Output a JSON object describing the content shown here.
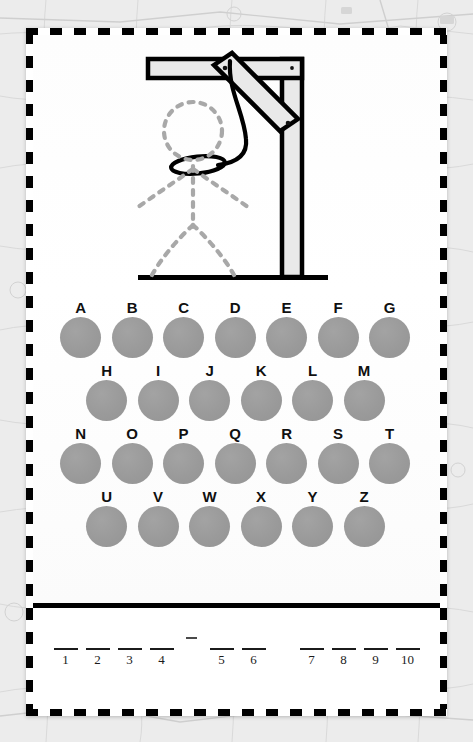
{
  "game": {
    "title": "Hangman",
    "gallows": {
      "name": "gallows-illustration",
      "beam_fill": "#e9e9e9",
      "beam_stroke": "#000000",
      "figure_stroke": "#a8a8a8",
      "rope_color": "#000000",
      "parts": [
        "ground-line",
        "vertical-post",
        "horizontal-beam",
        "diagonal-brace",
        "rope",
        "noose-loop"
      ],
      "figure_parts": [
        "head",
        "torso",
        "left-arm",
        "right-arm",
        "left-leg",
        "right-leg"
      ],
      "wrong_guesses": 0
    },
    "alphabet_rows": [
      {
        "indented": false,
        "letters": [
          "A",
          "B",
          "C",
          "D",
          "E",
          "F",
          "G"
        ]
      },
      {
        "indented": true,
        "letters": [
          "H",
          "I",
          "J",
          "K",
          "L",
          "M"
        ]
      },
      {
        "indented": false,
        "letters": [
          "N",
          "O",
          "P",
          "Q",
          "R",
          "S",
          "T"
        ]
      },
      {
        "indented": true,
        "letters": [
          "U",
          "V",
          "W",
          "X",
          "Y",
          "Z"
        ]
      }
    ],
    "answer": {
      "groups": [
        {
          "type": "word",
          "slots": [
            {
              "number": "1",
              "letter": ""
            },
            {
              "number": "2",
              "letter": ""
            },
            {
              "number": "3",
              "letter": ""
            },
            {
              "number": "4",
              "letter": ""
            }
          ]
        },
        {
          "type": "hyphen",
          "mark": "-"
        },
        {
          "type": "word",
          "slots": [
            {
              "number": "5",
              "letter": ""
            },
            {
              "number": "6",
              "letter": ""
            }
          ]
        },
        {
          "type": "gap"
        },
        {
          "type": "word",
          "slots": [
            {
              "number": "7",
              "letter": ""
            },
            {
              "number": "8",
              "letter": ""
            },
            {
              "number": "9",
              "letter": ""
            },
            {
              "number": "10",
              "letter": ""
            }
          ]
        }
      ],
      "total_blanks": 10
    },
    "colors": {
      "disc": "#9a9a9a",
      "letter": "#101010",
      "card": "#ffffff",
      "border": "#000000",
      "backdrop": "#ececec",
      "rule": "#1b1b1b"
    }
  }
}
